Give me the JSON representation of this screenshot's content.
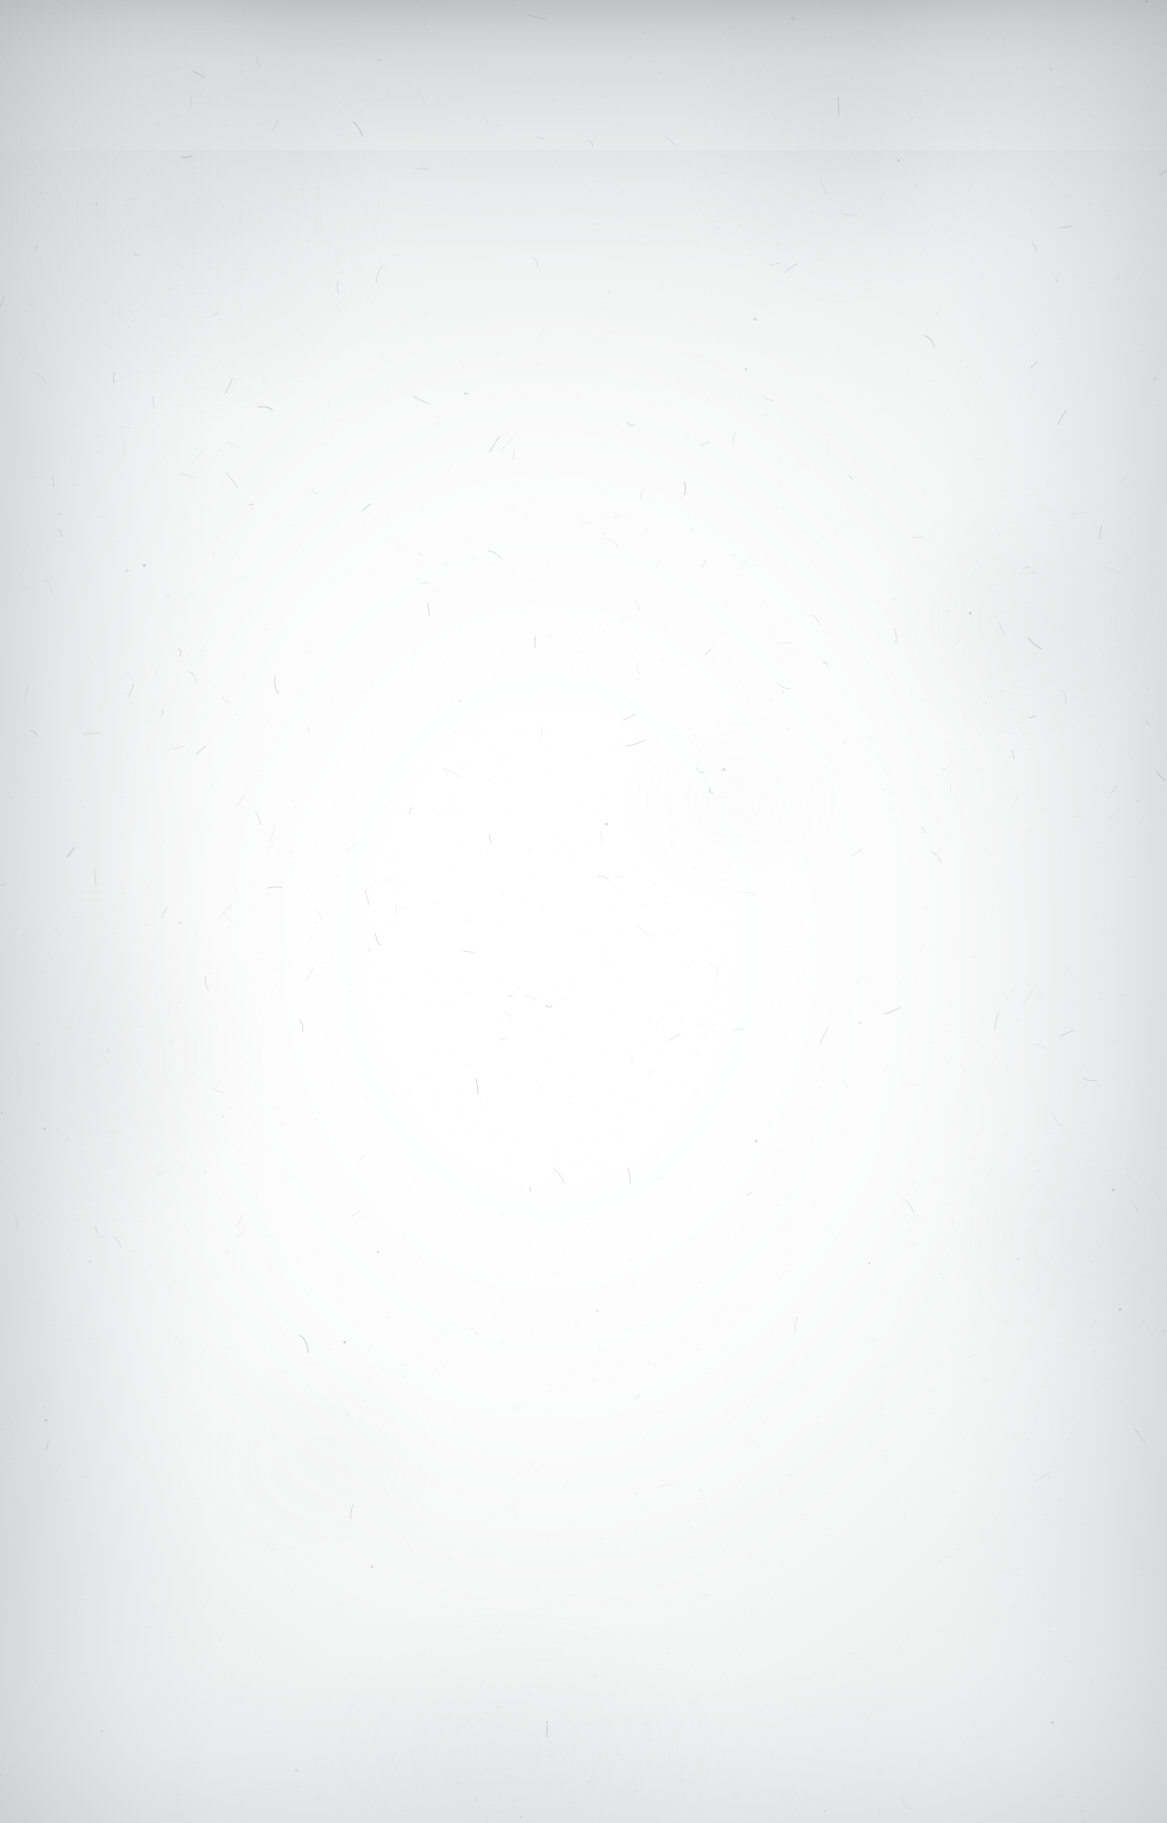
{
  "document": {
    "type": "scanned-page",
    "content_state": "blank",
    "description": "Blank scanned sheet of paper. No text, headings, figures, page numbers, marginalia or UI elements are present anywhere on the page.",
    "width_px": 1167,
    "height_px": 1823,
    "orientation": "portrait"
  },
  "appearance": {
    "paper_base_color": "#f1f2f2",
    "brightest_center_color": "#ffffff",
    "top_shadow_band_color": "#c4c5c6",
    "left_edge_shadow_color": "#c6c7c9",
    "right_edge_shadow_color": "#c8c9cb",
    "bottom_shadow_color": "#d6d7d9",
    "speckle_color": "#9a9a9c",
    "fibre_color": "#8e8f91"
  },
  "scan_artifacts": {
    "vignette": "darker grey band across the top edge, softer shading down the left and right margins, mild shading at the bottom, bright illuminated pool through the centre",
    "texture": "fine random paper-fibre speckle with scattered short dark hair-like fibres",
    "noise_seed": 20240117,
    "speckle_count": 5200,
    "fibre_count": 230
  },
  "text_content": {
    "lines": [],
    "note": "no visible text"
  }
}
